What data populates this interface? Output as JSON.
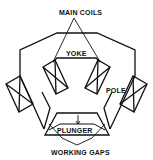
{
  "diagram": {
    "type": "electromagnet-cross-section",
    "labels": {
      "main_coils": "MAIN COILS",
      "yoke": "YOKE",
      "pole": "POLE",
      "plunger": "PLUNGER",
      "working_gaps": "WORKING GAPS"
    },
    "colors": {
      "line": "#111111",
      "background": "#ffffff"
    },
    "components": [
      "yoke",
      "main-coils",
      "poles",
      "plunger",
      "working-gaps"
    ]
  }
}
